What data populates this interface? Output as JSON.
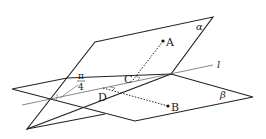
{
  "diagram": {
    "planes": [
      {
        "name": "alpha",
        "label": "α"
      },
      {
        "name": "beta",
        "label": "β"
      }
    ],
    "line": {
      "label": "l"
    },
    "points": {
      "A": "A",
      "B": "B",
      "C": "C",
      "D": "D"
    },
    "angle": {
      "numerator": "π",
      "denominator": "4"
    },
    "colors": {
      "stroke": "#222222",
      "thin": "#555555"
    }
  }
}
